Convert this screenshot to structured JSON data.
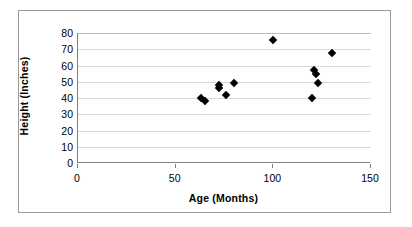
{
  "chart_data": {
    "type": "scatter",
    "title": "",
    "xlabel": "Age (Months)",
    "ylabel": "Height (Inches)",
    "xlim": [
      0,
      150
    ],
    "ylim": [
      0,
      80
    ],
    "xticks": [
      0,
      50,
      100,
      150
    ],
    "yticks": [
      0,
      10,
      20,
      30,
      40,
      50,
      60,
      70,
      80
    ],
    "grid": "horizontal",
    "legend": "none",
    "marker": "filled-diamond",
    "marker_color": "#000000",
    "series": [
      {
        "name": "Height vs Age",
        "points": [
          {
            "x": 63,
            "y": 40
          },
          {
            "x": 65,
            "y": 38
          },
          {
            "x": 72,
            "y": 48
          },
          {
            "x": 72,
            "y": 46
          },
          {
            "x": 76,
            "y": 42
          },
          {
            "x": 80,
            "y": 49
          },
          {
            "x": 100,
            "y": 76
          },
          {
            "x": 120,
            "y": 40
          },
          {
            "x": 121,
            "y": 57
          },
          {
            "x": 122,
            "y": 55
          },
          {
            "x": 123,
            "y": 49
          },
          {
            "x": 130,
            "y": 68
          }
        ]
      }
    ]
  },
  "axes": {
    "x_tick_labels": [
      "0",
      "50",
      "100",
      "150"
    ],
    "y_tick_labels": [
      "0",
      "10",
      "20",
      "30",
      "40",
      "50",
      "60",
      "70",
      "80"
    ]
  }
}
